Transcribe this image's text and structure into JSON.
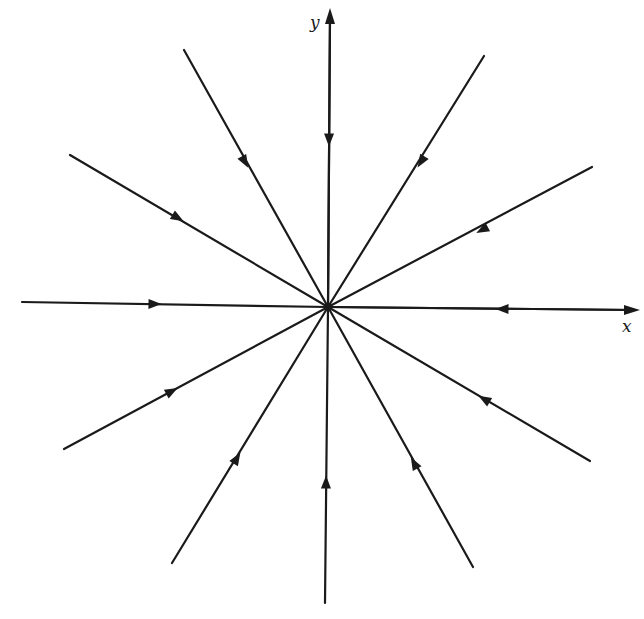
{
  "diagram": {
    "type": "phase-portrait",
    "colors": {
      "ink": "#1a1a1a",
      "background": "#ffffff"
    },
    "origin": [
      328,
      307
    ],
    "axes": {
      "x": {
        "label": "x",
        "from": [
          22,
          307
        ],
        "to": [
          636,
          310
        ]
      },
      "y": {
        "label": "y",
        "from": [
          328,
          307
        ],
        "to": [
          330,
          12
        ]
      }
    },
    "trajectories": [
      {
        "name": "up",
        "start": [
          330,
          16
        ],
        "arrow_at": [
          329,
          140
        ]
      },
      {
        "name": "upper-left-steep",
        "start": [
          184,
          50
        ],
        "arrow_at": [
          245,
          162
        ]
      },
      {
        "name": "upper-right-steep",
        "start": [
          484,
          56
        ],
        "arrow_at": [
          421,
          162
        ]
      },
      {
        "name": "upper-left-shallow",
        "start": [
          70,
          155
        ],
        "arrow_at": [
          178,
          218
        ]
      },
      {
        "name": "upper-right-shallow",
        "start": [
          592,
          167
        ],
        "arrow_at": [
          482,
          230
        ]
      },
      {
        "name": "left",
        "start": [
          22,
          302
        ],
        "arrow_at": [
          155,
          304
        ]
      },
      {
        "name": "right",
        "start": [
          634,
          310
        ],
        "arrow_at": [
          502,
          309
        ]
      },
      {
        "name": "lower-left-shallow",
        "start": [
          64,
          449
        ],
        "arrow_at": [
          172,
          391
        ]
      },
      {
        "name": "lower-right-shallow",
        "start": [
          590,
          461
        ],
        "arrow_at": [
          484,
          399
        ]
      },
      {
        "name": "lower-left-steep",
        "start": [
          172,
          563
        ],
        "arrow_at": [
          237,
          458
        ]
      },
      {
        "name": "lower-right-steep",
        "start": [
          473,
          567
        ],
        "arrow_at": [
          414,
          463
        ]
      },
      {
        "name": "down",
        "start": [
          325,
          603
        ],
        "arrow_at": [
          326,
          482
        ]
      }
    ]
  }
}
